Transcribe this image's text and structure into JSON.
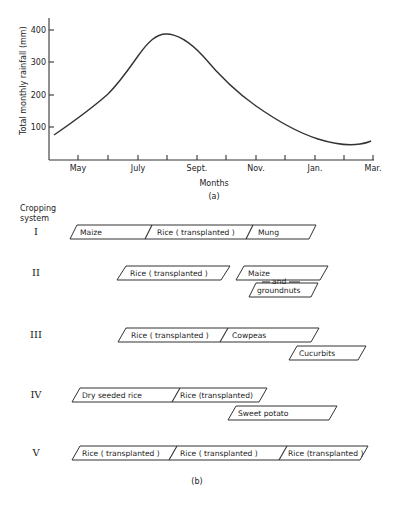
{
  "chart_data": [
    {
      "panel": "(a)",
      "type": "line",
      "title": "",
      "xlabel": "Months",
      "ylabel": "Total monthly rainfall (mm)",
      "x_tick_labels": [
        "May",
        "July",
        "Sept.",
        "Nov.",
        "Jan.",
        "Mar."
      ],
      "x_ticks_monthly": [
        "May",
        "Jun",
        "Jul",
        "Aug",
        "Sep",
        "Oct",
        "Nov",
        "Dec",
        "Jan",
        "Feb",
        "Mar"
      ],
      "y_ticks": [
        100,
        200,
        300,
        400
      ],
      "ylim": [
        0,
        430
      ],
      "grid": false,
      "legend": null,
      "series": [
        {
          "name": "Total monthly rainfall",
          "x": [
            "Apr-end",
            "May",
            "Jun",
            "Jul",
            "Aug",
            "Sep",
            "Oct",
            "Nov",
            "Dec",
            "Jan",
            "Feb",
            "Mar"
          ],
          "values": [
            77,
            125,
            200,
            320,
            388,
            345,
            240,
            150,
            90,
            58,
            49,
            55
          ]
        }
      ]
    },
    {
      "panel": "(b)",
      "type": "table",
      "title": "Cropping system",
      "systems": [
        {
          "id": "I",
          "crops": [
            "Maize",
            "Rice ( transplanted )",
            "Mung"
          ]
        },
        {
          "id": "II",
          "crops": [
            "Rice ( transplanted )",
            "Maize and groundnuts"
          ]
        },
        {
          "id": "III",
          "crops": [
            "Rice ( transplanted )",
            "Cowpeas",
            "Cucurbits"
          ]
        },
        {
          "id": "IV",
          "crops": [
            "Dry seeded rice",
            "Rice (transplanted)",
            "Sweet potato"
          ]
        },
        {
          "id": "V",
          "crops": [
            "Rice ( transplanted )",
            "Rice ( transplanted )",
            "Rice (transplanted )"
          ]
        }
      ]
    }
  ],
  "panel_a": {
    "ylabel": "Total monthly rainfall (mm)",
    "xlabel": "Months",
    "caption": "(a)",
    "y_ticks": [
      {
        "label": "400",
        "y": 30
      },
      {
        "label": "300",
        "y": 62
      },
      {
        "label": "200",
        "y": 95
      },
      {
        "label": "100",
        "y": 127
      }
    ],
    "x_ticks": [
      78,
      108,
      138,
      167,
      197,
      226,
      256,
      285,
      315,
      344,
      373
    ],
    "x_labels": [
      {
        "label": "May",
        "x": 78
      },
      {
        "label": "July",
        "x": 138
      },
      {
        "label": "Sept.",
        "x": 197
      },
      {
        "label": "Nov.",
        "x": 256
      },
      {
        "label": "Jan.",
        "x": 315
      },
      {
        "label": "Mar.",
        "x": 373
      }
    ],
    "curve_path": "M54,135 C70,124 90,110 108,94 C120,82 128,70 138,56 C148,42 156,34 166,34 C178,34 190,42 203,56 C218,74 236,92 256,106 C276,120 296,132 318,139 C334,144 348,146 360,144 C366,143 369,142 371,141"
  },
  "panel_b": {
    "header_line1": "Cropping",
    "header_line2": "system",
    "caption": "(b)",
    "rows": [
      {
        "roman": "I",
        "roman_y": 235,
        "bars": [
          {
            "x1": 70,
            "x2": 309,
            "y": 225,
            "h": 14,
            "slant": 7,
            "dividers": [
              152,
              253
            ],
            "labels": [
              {
                "text": "Maize",
                "x": 80
              },
              {
                "text": "Rice ( transplanted )",
                "x": 157
              },
              {
                "text": "Mung",
                "x": 258
              }
            ]
          }
        ]
      },
      {
        "roman": "II",
        "roman_y": 276,
        "bars": [
          {
            "x1": 117,
            "x2": 221,
            "y": 266,
            "h": 14,
            "slant": 9,
            "dividers": [],
            "labels": [
              {
                "text": "Rice ( transplanted )",
                "x": 130
              }
            ]
          },
          {
            "x1": 236,
            "x2": 320,
            "y": 266,
            "h": 14,
            "slant": 8,
            "dividers": [],
            "labels": [
              {
                "text": "Maize",
                "x": 248
              }
            ]
          },
          {
            "x1": 249,
            "x2": 311,
            "y": 283,
            "h": 14,
            "slant": 7,
            "dividers": [],
            "labels": [
              {
                "text": "groundnuts",
                "x": 257
              }
            ]
          }
        ],
        "connector": {
          "text": "and",
          "x": 272,
          "y": 284
        }
      },
      {
        "roman": "III",
        "roman_y": 338,
        "bars": [
          {
            "x1": 118,
            "x2": 311,
            "y": 328,
            "h": 14,
            "slant": 8,
            "dividers": [
              228
            ],
            "labels": [
              {
                "text": "Rice ( transplanted )",
                "x": 131
              },
              {
                "text": "Cowpeas",
                "x": 232
              }
            ]
          },
          {
            "x1": 289,
            "x2": 358,
            "y": 346,
            "h": 14,
            "slant": 8,
            "dividers": [],
            "labels": [
              {
                "text": "Cucurbits",
                "x": 299
              }
            ]
          }
        ]
      },
      {
        "roman": "IV",
        "roman_y": 398,
        "bars": [
          {
            "x1": 72,
            "x2": 259,
            "y": 388,
            "h": 14,
            "slant": 8,
            "dividers": [
              180
            ],
            "labels": [
              {
                "text": "Dry seeded rice",
                "x": 82
              },
              {
                "text": "Rice (transplanted)",
                "x": 180
              }
            ]
          },
          {
            "x1": 228,
            "x2": 329,
            "y": 406,
            "h": 14,
            "slant": 8,
            "dividers": [],
            "labels": [
              {
                "text": "Sweet potato",
                "x": 238
              }
            ]
          }
        ]
      },
      {
        "roman": "V",
        "roman_y": 456,
        "bars": [
          {
            "x1": 72,
            "x2": 360,
            "y": 446,
            "h": 14,
            "slant": 8,
            "dividers": [
              177,
              287
            ],
            "labels": [
              {
                "text": "Rice ( transplanted )",
                "x": 82
              },
              {
                "text": "Rice ( transplanted )",
                "x": 180
              },
              {
                "text": "Rice (transplanted )",
                "x": 288
              }
            ]
          }
        ]
      }
    ]
  }
}
